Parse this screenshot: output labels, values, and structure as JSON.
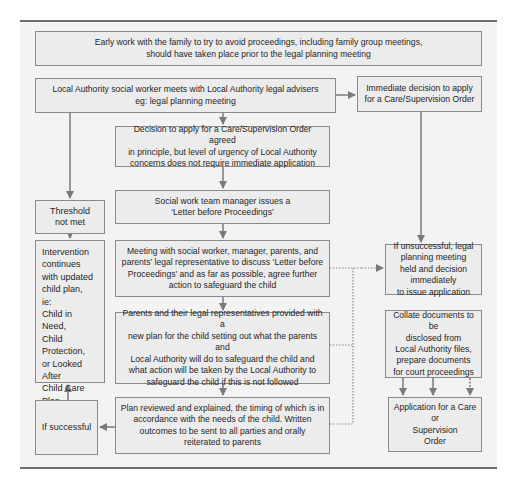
{
  "diagram": {
    "colors": {
      "box_fill": "#ececec",
      "box_border": "#8a8a8a",
      "arrow": "#7a7a7a",
      "panel": "#f3f3f3",
      "rule": "#6e6e6e"
    },
    "nodes": {
      "early_work": "Early work with the family to try to avoid proceedings, including family group meetings,\nshould have taken place prior to the legal planning meeting",
      "la_meets": "Local Authority social worker meets with Local Authority legal advisers\neg: legal planning meeting",
      "immediate_decision": "Immediate decision to apply\nfor a Care/Supervision Order",
      "decision_in_principle": "Decision to apply for a Care/Supervision Order agreed\nin principle, but level of urgency of Local Authority\nconcerns does not require immediate application",
      "threshold_not_met": "Threshold\nnot met",
      "letter_before_proceedings": "Social work team manager issues a\n‘Letter before Proceedings’",
      "intervention_continues": "Intervention\ncontinues\nwith updated\nchild plan,\nie:\nChild in\nNeed,\nChild\nProtection,\nor Looked\nAfter\nChild Care\nPlan",
      "meeting": "Meeting with social worker, manager, parents, and\nparents’ legal representative to discuss ‘Letter before\nProceedings’ and as far as possible, agree further\naction to safeguard the child",
      "if_unsuccessful": "If unsuccessful, legal\nplanning meeting\nheld and decision\nimmediately\nto issue application",
      "new_plan": "Parents and their legal representatives provided with a\nnew plan for the child setting out what the parents and\nLocal Authority will do to safeguard the child and\nwhat action will be taken by the Local Authority to\nsafeguard the child if this is not followed",
      "collate_documents": "Collate documents to be\ndisclosed from\nLocal Authority files,\nprepare documents\nfor court proceedings",
      "if_successful": "If successful",
      "plan_reviewed": "Plan reviewed and explained, the timing of which is in\naccordance with the needs of the child.  Written\noutcomes to be sent to all parties and orally\nreiterated to parents",
      "application": "Application for a Care or\nSupervision\nOrder"
    },
    "edges": [
      [
        "la_meets",
        "immediate_decision",
        "solid"
      ],
      [
        "la_meets",
        "decision_in_principle",
        "solid"
      ],
      [
        "la_meets",
        "threshold_not_met",
        "solid"
      ],
      [
        "immediate_decision",
        "if_unsuccessful",
        "solid"
      ],
      [
        "decision_in_principle",
        "letter_before_proceedings",
        "solid"
      ],
      [
        "threshold_not_met",
        "intervention_continues",
        "solid"
      ],
      [
        "letter_before_proceedings",
        "meeting",
        "solid"
      ],
      [
        "meeting",
        "new_plan",
        "solid"
      ],
      [
        "new_plan",
        "plan_reviewed",
        "solid"
      ],
      [
        "plan_reviewed",
        "if_successful",
        "solid"
      ],
      [
        "if_successful",
        "intervention_continues",
        "solid"
      ],
      [
        "meeting",
        "if_unsuccessful",
        "dotted"
      ],
      [
        "new_plan",
        "if_unsuccessful",
        "dotted"
      ],
      [
        "plan_reviewed",
        "if_unsuccessful",
        "dotted"
      ],
      [
        "collate_documents",
        "application",
        "solid"
      ]
    ]
  }
}
